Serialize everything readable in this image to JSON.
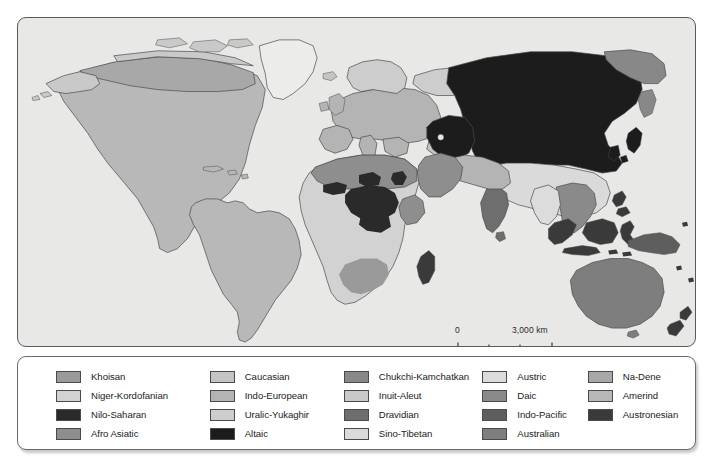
{
  "map": {
    "title": "World Language Families Map",
    "background_color": "#e8e8e6",
    "ocean_color": "#e8e8e6",
    "coastline_color": "#4a4a4a",
    "scale": {
      "zero_label": "0",
      "max_label": "3,000 km"
    }
  },
  "palette": {
    "khoisan": "#9a9a9a",
    "niger_kordofanian": "#d2d2d2",
    "nilo_saharan": "#2a2a2a",
    "afro_asiatic": "#8e8e8e",
    "caucasian": "#c4c4c4",
    "indo_european": "#b4b4b4",
    "uralic_yukaghir": "#cdcdcd",
    "altaic": "#1c1c1c",
    "chukchi_kamchatkan": "#888888",
    "inuit_aleut": "#c9c9c9",
    "dravidian": "#6e6e6e",
    "sino_tibetan": "#dadada",
    "austric": "#dcdcdc",
    "daic": "#8a8a8a",
    "indo_pacific": "#5e5e5e",
    "australian": "#7e7e7e",
    "na_dene": "#a8a8a8",
    "amerind": "#b8b8b8",
    "austronesian": "#3a3a3a"
  },
  "legend": {
    "columns": [
      {
        "items": [
          {
            "label": "Khoisan",
            "color": "#9a9a9a"
          },
          {
            "label": "Niger-Kordofanian",
            "color": "#d2d2d2"
          },
          {
            "label": "Nilo-Saharan",
            "color": "#2a2a2a"
          },
          {
            "label": "Afro Asiatic",
            "color": "#8e8e8e"
          }
        ]
      },
      {
        "items": [
          {
            "label": "Caucasian",
            "color": "#c4c4c4"
          },
          {
            "label": "Indo-European",
            "color": "#b4b4b4"
          },
          {
            "label": "Uralic-Yukaghir",
            "color": "#cdcdcd"
          },
          {
            "label": "Altaic",
            "color": "#1c1c1c"
          }
        ]
      },
      {
        "items": [
          {
            "label": "Chukchi-Kamchatkan",
            "color": "#888888"
          },
          {
            "label": "Inuit-Aleut",
            "color": "#c9c9c9"
          },
          {
            "label": "Dravidian",
            "color": "#6e6e6e"
          },
          {
            "label": "Sino-Tibetan",
            "color": "#dadada"
          }
        ]
      },
      {
        "items": [
          {
            "label": "Austric",
            "color": "#dcdcdc"
          },
          {
            "label": "Daic",
            "color": "#8a8a8a"
          },
          {
            "label": "Indo-Pacific",
            "color": "#5e5e5e"
          },
          {
            "label": "Australian",
            "color": "#7e7e7e"
          }
        ]
      },
      {
        "items": [
          {
            "label": "Na-Dene",
            "color": "#a8a8a8"
          },
          {
            "label": "Amerind",
            "color": "#b8b8b8"
          },
          {
            "label": "Austronesian",
            "color": "#3a3a3a"
          }
        ]
      }
    ]
  }
}
